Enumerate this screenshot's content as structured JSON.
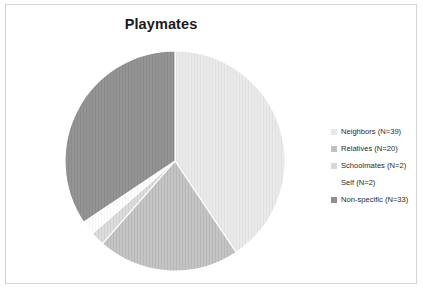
{
  "chart": {
    "title": "Playmates",
    "frame_border_color": "#d4d4d4",
    "background_color": "#ffffff"
  },
  "chart_data": {
    "type": "pie",
    "title": "Playmates",
    "xlabel": "",
    "ylabel": "",
    "total": 96,
    "start_angle_deg": 0,
    "direction": "clockwise",
    "legend_position": "right",
    "grid": false,
    "categories": [
      "Neighbors",
      "Relatives",
      "Schoolmates",
      "Self",
      "Non-specific"
    ],
    "values": [
      39,
      20,
      2,
      2,
      33
    ],
    "legend_labels": [
      "Neighbors (N=39)",
      "Relatives (N=20)",
      "Schoolmates (N=2)",
      "Self (N=2)",
      "Non-specific (N=33)"
    ],
    "slice_colors": [
      "#e8e8e8",
      "#c0c0c0",
      "#d8d8d8",
      "#ffffff",
      "#8f8f8f"
    ],
    "slice_angles_deg": [
      146.25,
      75.0,
      7.5,
      7.5,
      123.75
    ],
    "percentages": [
      "40.6%",
      "20.8%",
      "2.1%",
      "2.1%",
      "34.4%"
    ],
    "slices": [
      {
        "label": "Neighbors",
        "legend": "Neighbors (N=39)",
        "value": 39,
        "color": "#e8e8e8",
        "angle_deg": 146.25
      },
      {
        "label": "Relatives",
        "legend": "Relatives (N=20)",
        "value": 20,
        "color": "#c0c0c0",
        "angle_deg": 75.0
      },
      {
        "label": "Schoolmates",
        "legend": "Schoolmates (N=2)",
        "value": 2,
        "color": "#d8d8d8",
        "angle_deg": 7.5
      },
      {
        "label": "Self",
        "legend": "Self (N=2)",
        "value": 2,
        "color": "#ffffff",
        "angle_deg": 7.5
      },
      {
        "label": "Non-specific",
        "legend": "Non-specific (N=33)",
        "value": 33,
        "color": "#8f8f8f",
        "angle_deg": 123.75
      }
    ]
  }
}
